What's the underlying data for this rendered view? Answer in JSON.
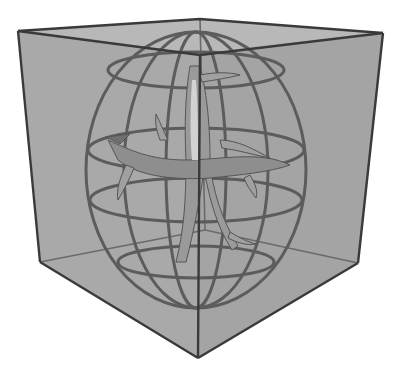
{
  "figure": {
    "colors": {
      "background": "#ffffff",
      "cube_face": "#a9a9a9",
      "cube_top_face": "#b8b8b8",
      "cube_edge": "#3a3a3a",
      "sphere_wire": "#5a5a5a",
      "tree_fill": "#9a9a9a",
      "tree_highlight": "#d2d2d2",
      "tree_shadow": "#707070"
    },
    "cube": {
      "vertices": {
        "top_left": [
          18,
          31
        ],
        "top_back": [
          200,
          19
        ],
        "top_right": [
          383,
          33
        ],
        "top_front": [
          200,
          55
        ],
        "bottom_left": [
          40,
          262
        ],
        "bottom_front": [
          198,
          358
        ],
        "bottom_right": [
          358,
          263
        ],
        "bottom_back": [
          205,
          230
        ]
      }
    },
    "sphere": {
      "center": [
        200,
        175
      ],
      "radius_x": 118,
      "radius_y": 145
    }
  }
}
